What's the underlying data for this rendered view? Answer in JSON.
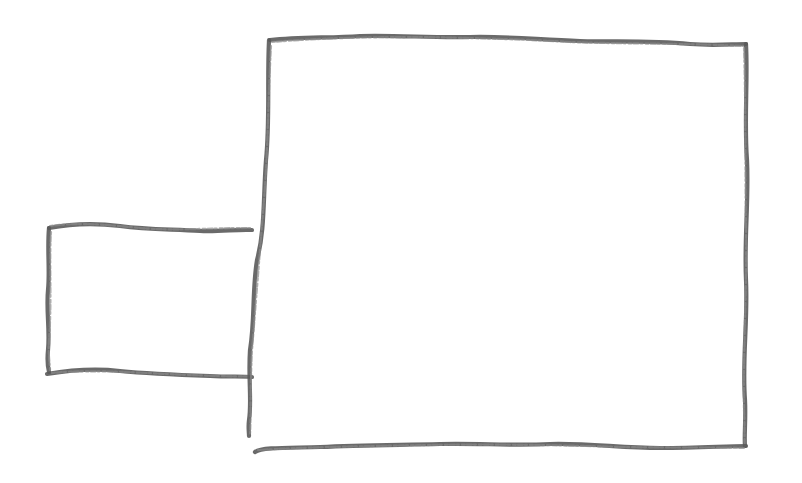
{
  "diagram": {
    "type": "hand-drawn sketch",
    "colors": {
      "background": "#ffffff",
      "stroke": "#5a5a5a"
    },
    "shapes": [
      {
        "id": "small-box",
        "kind": "rectangle",
        "x": 48,
        "y": 226,
        "width": 204,
        "height": 150,
        "text": ""
      },
      {
        "id": "large-box",
        "kind": "rectangle",
        "x": 250,
        "y": 38,
        "width": 496,
        "height": 410,
        "text": ""
      }
    ]
  }
}
